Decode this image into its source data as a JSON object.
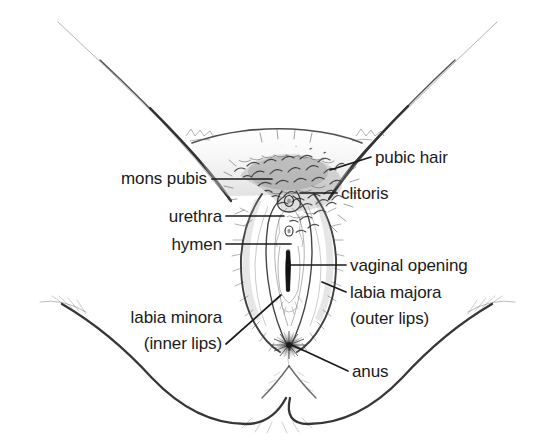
{
  "figure": {
    "type": "anatomical-diagram",
    "view": "frontal / lithotomy view of the vulva and perineum",
    "background_color": "#ffffff",
    "ink_color": "#1a1a1a",
    "text_color": "#1a1a1a",
    "width": 550,
    "height": 446
  },
  "labels": [
    {
      "id": "pubic-hair",
      "text": "pubic hair",
      "side": "right",
      "x": 375,
      "y": 163,
      "leader": {
        "from": [
          371,
          157
        ],
        "to": [
          330,
          170
        ]
      }
    },
    {
      "id": "mons-pubis",
      "text": "mons pubis",
      "side": "left",
      "x": 207,
      "y": 184,
      "leader": {
        "from": [
          212,
          179
        ],
        "to": [
          272,
          179
        ]
      }
    },
    {
      "id": "clitoris",
      "text": "clitoris",
      "side": "right",
      "x": 341,
      "y": 199,
      "leader": {
        "from": [
          337,
          193
        ],
        "to": [
          300,
          193
        ]
      }
    },
    {
      "id": "urethra",
      "text": "urethra",
      "side": "left",
      "x": 222,
      "y": 222,
      "leader": {
        "from": [
          226,
          216
        ],
        "to": [
          284,
          216
        ]
      }
    },
    {
      "id": "hymen",
      "text": "hymen",
      "side": "left",
      "x": 222,
      "y": 250,
      "leader": {
        "from": [
          226,
          244
        ],
        "to": [
          291,
          244
        ]
      }
    },
    {
      "id": "vaginal-opening",
      "text": "vaginal opening",
      "side": "right",
      "x": 350,
      "y": 271,
      "leader": {
        "from": [
          346,
          265
        ],
        "to": [
          287,
          265
        ]
      }
    },
    {
      "id": "labia-majora",
      "text": "labia majora",
      "side": "right",
      "x": 350,
      "y": 298,
      "leader": {
        "from": [
          346,
          292
        ],
        "to": [
          322,
          282
        ]
      }
    },
    {
      "id": "labia-majora-sub",
      "text": "(outer lips)",
      "side": "right",
      "x": 350,
      "y": 324,
      "leader": null
    },
    {
      "id": "labia-minora",
      "text": "labia minora",
      "side": "left",
      "x": 222,
      "y": 323,
      "leader": null
    },
    {
      "id": "labia-minora-sub",
      "text": "(inner lips)",
      "side": "left",
      "x": 222,
      "y": 349,
      "leader": {
        "from": [
          226,
          344
        ],
        "to": [
          281,
          295
        ]
      }
    },
    {
      "id": "anus",
      "text": "anus",
      "side": "right",
      "x": 352,
      "y": 377,
      "leader": {
        "from": [
          348,
          371
        ],
        "to": [
          292,
          345
        ]
      }
    }
  ],
  "structures": [
    {
      "id": "left-thigh",
      "name": "left inner thigh outline"
    },
    {
      "id": "right-thigh",
      "name": "right inner thigh outline"
    },
    {
      "id": "mons-mound",
      "name": "mons pubis mound"
    },
    {
      "id": "pubic-hair-patch",
      "name": "pubic hair patch"
    },
    {
      "id": "clitoral-hood",
      "name": "clitoral hood / prepuce"
    },
    {
      "id": "clitoral-glans",
      "name": "clitoral glans"
    },
    {
      "id": "urethral-opening",
      "name": "urethral meatus"
    },
    {
      "id": "labia-minora-folds",
      "name": "labia minora inner folds"
    },
    {
      "id": "vaginal-introitus",
      "name": "vaginal opening"
    },
    {
      "id": "labia-majora-left",
      "name": "left labium majus"
    },
    {
      "id": "labia-majora-right",
      "name": "right labium majus"
    },
    {
      "id": "perineum",
      "name": "perineum"
    },
    {
      "id": "anus-star",
      "name": "anus"
    },
    {
      "id": "buttock-left",
      "name": "left buttock curve"
    },
    {
      "id": "buttock-right",
      "name": "right buttock curve"
    }
  ]
}
